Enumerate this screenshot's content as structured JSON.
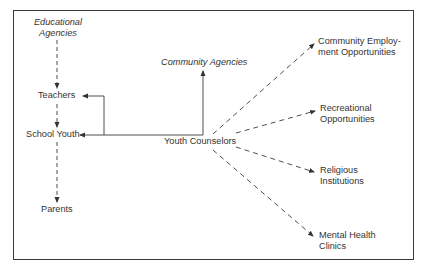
{
  "diagram": {
    "type": "flow",
    "nodes": {
      "educational_agencies": {
        "line1": "Educational",
        "line2": "Agencies",
        "style": "italic"
      },
      "teachers": {
        "label": "Teachers"
      },
      "school_youth": {
        "label": "School Youth"
      },
      "parents": {
        "label": "Parents"
      },
      "community_agencies": {
        "label": "Community Agencies",
        "style": "italic"
      },
      "youth_counselors": {
        "label": "Youth Counselors"
      },
      "community_employment": {
        "line1": "Community Employ-",
        "line2": "ment Opportunities"
      },
      "recreational": {
        "line1": "Recreational",
        "line2": "Opportunities"
      },
      "religious": {
        "line1": "Religious",
        "line2": "Institutions"
      },
      "mental_health": {
        "line1": "Mental Health",
        "line2": "Clinics"
      }
    },
    "edges": [
      {
        "from": "Educational Agencies",
        "to": "Teachers",
        "style": "dashed"
      },
      {
        "from": "Teachers",
        "to": "School Youth",
        "style": "dashed"
      },
      {
        "from": "School Youth",
        "to": "Parents",
        "style": "dashed"
      },
      {
        "from": "Youth Counselors",
        "to": "Teachers",
        "style": "solid"
      },
      {
        "from": "Youth Counselors",
        "to": "School Youth",
        "style": "solid"
      },
      {
        "from": "Youth Counselors",
        "to": "Community Agencies",
        "style": "solid"
      },
      {
        "from": "Youth Counselors",
        "to": "Community Employment Opportunities",
        "style": "dashed"
      },
      {
        "from": "Youth Counselors",
        "to": "Recreational Opportunities",
        "style": "dashed"
      },
      {
        "from": "Youth Counselors",
        "to": "Religious Institutions",
        "style": "dashed"
      },
      {
        "from": "Youth Counselors",
        "to": "Mental Health Clinics",
        "style": "dashed"
      }
    ],
    "colors": {
      "line": "#3a3a3a",
      "text": "#333333"
    }
  }
}
